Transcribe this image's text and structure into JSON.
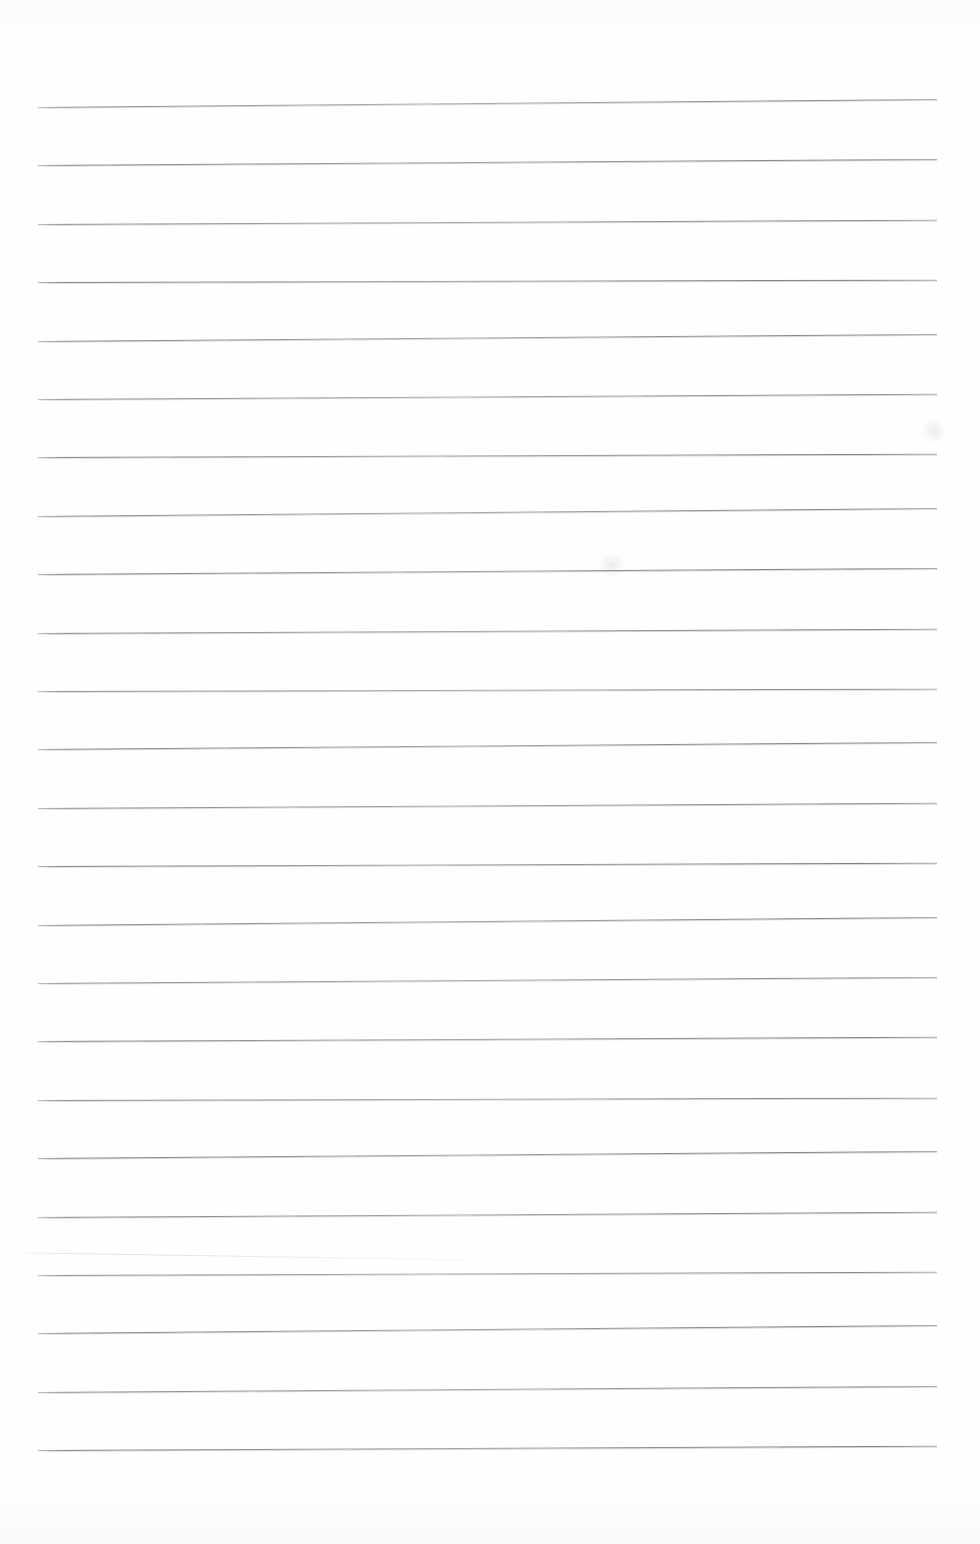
{
  "document": {
    "kind": "scanned-ruled-paper",
    "title": "Blank ruled notebook page",
    "page_width": 980,
    "page_height": 1544,
    "paper_color": "#ffffff",
    "has_text": false,
    "has_handwriting": false,
    "body_text": ""
  },
  "ruling": {
    "line_color": "#7d8086",
    "line_count": 24,
    "first_line_y": 107,
    "line_spacing": 58.4,
    "left_margin_x": 38,
    "right_end_x": 937,
    "line_thickness": 1,
    "tilt_degrees": -0.33,
    "margin_rule": "none",
    "header_rule": "none"
  },
  "line_positions": [
    107.0,
    165.4,
    223.8,
    282.2,
    340.6,
    399.0,
    457.4,
    515.8,
    574.2,
    632.6,
    691.0,
    749.4,
    807.8,
    866.2,
    924.6,
    983.0,
    1041.4,
    1099.8,
    1158.2,
    1216.6,
    1275.0,
    1333.4,
    1391.8,
    1450.2
  ],
  "artifacts": [
    {
      "name": "faint-smudge-upper-right",
      "x": 921,
      "y": 418,
      "w": 26,
      "h": 26
    },
    {
      "name": "faint-smudge-mid-center",
      "x": 598,
      "y": 552,
      "w": 28,
      "h": 26
    },
    {
      "name": "paper-crease-lower-left",
      "x": 0,
      "y": 1252,
      "w": 560,
      "rotate": 0.9
    }
  ],
  "margins": {
    "top_blank_height": 107,
    "bottom_blank_height": 92,
    "left_blank_width": 38,
    "right_blank_width": 43
  }
}
